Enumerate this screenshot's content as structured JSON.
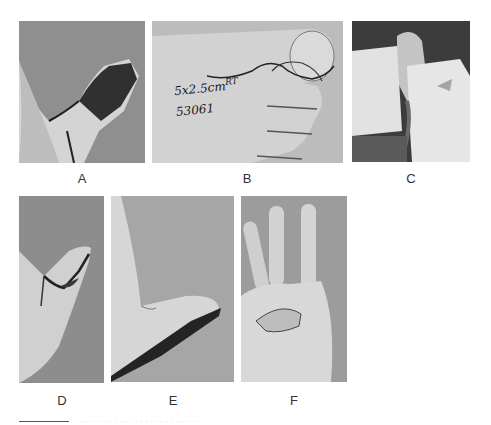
{
  "figure": {
    "panels": [
      {
        "id": "A",
        "label": "A",
        "description": "Thumb tip with dark necrotic eschar, gray background"
      },
      {
        "id": "B",
        "label": "B",
        "description": "Foot/great toe with marked flap outline",
        "annotation_line1": "5x2.5cm",
        "annotation_sup": "RT",
        "annotation_line2": "53061"
      },
      {
        "id": "C",
        "label": "C",
        "description": "Intraoperative view with surgical drapes"
      },
      {
        "id": "D",
        "label": "D",
        "description": "Thumb with sutured flap"
      },
      {
        "id": "E",
        "label": "E",
        "description": "Healed thumb, lateral view"
      },
      {
        "id": "F",
        "label": "F",
        "description": "Palm view with thumb flexed"
      }
    ],
    "caption": "· · · · · · · · · · · · · · · · · · · · · · · ·"
  },
  "colors": {
    "background_gray": "#8c8c8c",
    "skin_light": "#d8d8d8",
    "dark": "#2a2a2a"
  }
}
